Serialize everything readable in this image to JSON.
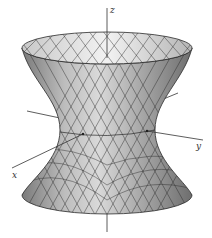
{
  "figure": {
    "axes": {
      "z": {
        "label": "z"
      },
      "x": {
        "label": "x"
      },
      "y": {
        "label": "y"
      }
    },
    "colors": {
      "surface_light": "#e6e6e6",
      "surface_dark": "#8a8a8a",
      "mesh": "#2a2a2a",
      "axis": "#333333"
    }
  }
}
